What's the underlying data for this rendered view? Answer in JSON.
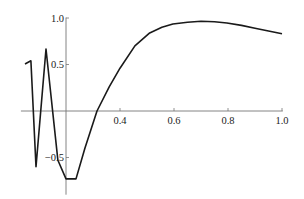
{
  "chart_data": {
    "type": "line",
    "title": "",
    "xlabel": "",
    "ylabel": "",
    "axes_origin": [
      0.2,
      0
    ],
    "xlim": [
      0.033,
      1.0
    ],
    "ylim": [
      -0.78,
      1.0
    ],
    "grid": false,
    "legend": null,
    "x_ticks": [
      0.4,
      0.6,
      0.8,
      1.0
    ],
    "x_tick_labels": [
      "0.4",
      "0.6",
      "0.8",
      "1.0"
    ],
    "y_ticks": [
      -0.5,
      0.5,
      1.0
    ],
    "y_tick_labels": [
      "-0.5",
      "0.5",
      "1.0"
    ],
    "series": [
      {
        "name": "f(x)",
        "color": "#1a1a1a",
        "x": [
          0.048,
          0.07,
          0.089,
          0.126,
          0.17,
          0.2,
          0.237,
          0.27,
          0.315,
          0.36,
          0.4,
          0.455,
          0.51,
          0.555,
          0.596,
          0.65,
          0.7,
          0.75,
          0.796,
          0.85,
          0.9,
          0.95,
          1.0
        ],
        "y": [
          0.505,
          0.54,
          -0.6,
          0.667,
          -0.53,
          -0.73,
          -0.73,
          -0.4,
          0.0,
          0.26,
          0.46,
          0.7,
          0.84,
          0.9,
          0.935,
          0.955,
          0.965,
          0.96,
          0.946,
          0.92,
          0.89,
          0.86,
          0.83
        ]
      }
    ]
  },
  "layout": {
    "plot_px": {
      "x0_px": 12,
      "px_per_x": 270,
      "y0_px": 111,
      "px_per_y": 93
    },
    "x_axis_span": [
      0.033,
      1.003
    ],
    "y_axis_span": [
      -0.9,
      1.005
    ]
  }
}
